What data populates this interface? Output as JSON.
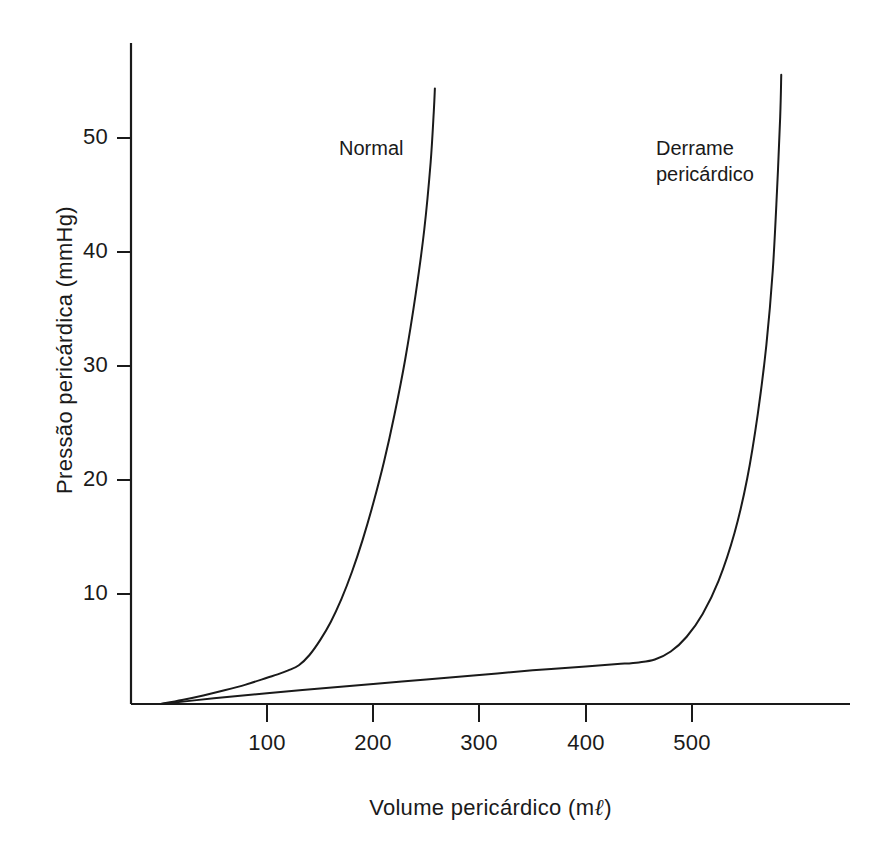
{
  "chart_data": {
    "type": "line",
    "title": "",
    "xlabel": "Volume pericárdico (mℓ)",
    "ylabel": "Pressão pericárdica (mmHg)",
    "xlabel_main": "Volume pericárdico (m",
    "xlabel_unit_suffix": ")",
    "xlabel_script_ell": "ℓ",
    "xlim": [
      0,
      650
    ],
    "ylim": [
      0,
      58
    ],
    "xticks": [
      100,
      200,
      300,
      400,
      500
    ],
    "xtick_labels": [
      "100",
      "200",
      "300",
      "400",
      "500"
    ],
    "yticks": [
      10,
      20,
      30,
      40,
      50
    ],
    "ytick_labels": [
      "10",
      "20",
      "30",
      "40",
      "50"
    ],
    "grid": false,
    "legend_position": "inline-annotations",
    "series": [
      {
        "name": "Normal",
        "label_line1": "Normal",
        "label_line2": "",
        "x": [
          0,
          20,
          40,
          60,
          80,
          100,
          110,
          120,
          130,
          140,
          150,
          160,
          170,
          180,
          190,
          200,
          210,
          220,
          230,
          240,
          248,
          254,
          257,
          258
        ],
        "y": [
          0,
          0.35,
          0.75,
          1.2,
          1.7,
          2.3,
          2.6,
          2.95,
          3.4,
          4.3,
          5.6,
          7.2,
          9.2,
          11.6,
          14.4,
          17.6,
          21.2,
          25.4,
          30.2,
          36.0,
          41.6,
          47.5,
          52.0,
          54.0
        ]
      },
      {
        "name": "Derrame pericárdico",
        "label_line1": "Derrame",
        "label_line2": "pericárdico",
        "x": [
          0,
          50,
          100,
          150,
          200,
          250,
          300,
          350,
          400,
          430,
          450,
          465,
          480,
          495,
          510,
          525,
          540,
          552,
          562,
          570,
          576,
          580,
          583,
          584
        ],
        "y": [
          0,
          0.5,
          0.95,
          1.35,
          1.75,
          2.15,
          2.55,
          2.95,
          3.3,
          3.5,
          3.65,
          3.9,
          4.6,
          5.9,
          7.9,
          10.8,
          15.0,
          19.8,
          25.5,
          31.5,
          38.0,
          45.0,
          51.5,
          55.2
        ]
      }
    ]
  },
  "annotations": {
    "normal_label": {
      "line1": "Normal",
      "line2": ""
    },
    "effusion_label": {
      "line1": "Derrame",
      "line2": "pericárdico"
    }
  },
  "axes": {
    "y_title": "Pressão pericárdica (mmHg)",
    "x_title_prefix": "Volume pericárdico (m",
    "x_title_ell": "ℓ",
    "x_title_suffix": ")"
  },
  "colors": {
    "background": "#ffffff",
    "axis": "#1a1a1a",
    "curve": "#1a1a1a",
    "text": "#1a1a1a"
  }
}
